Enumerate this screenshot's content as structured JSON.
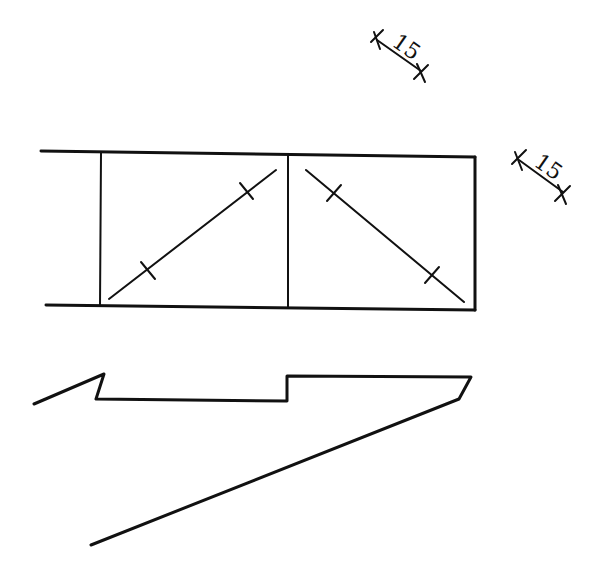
{
  "diagram": {
    "type": "technical-drawing",
    "dimension_labels": [
      {
        "id": "dim-top",
        "value": "15"
      },
      {
        "id": "dim-right",
        "value": "15"
      }
    ],
    "elements": [
      "two-bay rectangular frame with diagonal bracing and tick marks",
      "stepped profile with tapered lower edge"
    ]
  }
}
